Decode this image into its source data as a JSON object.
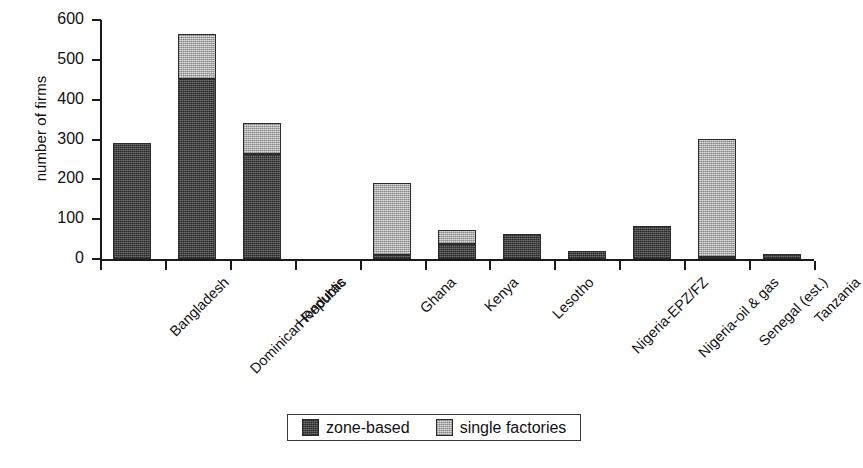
{
  "chart_data": {
    "type": "bar",
    "stacked": true,
    "title": "",
    "xlabel": "",
    "ylabel": "number of firms",
    "ylim": [
      0,
      600
    ],
    "ytick_values": [
      0,
      100,
      200,
      300,
      400,
      500,
      600
    ],
    "ytick_labels": [
      "0",
      "100",
      "200",
      "300",
      "400",
      "500",
      "600"
    ],
    "grid": false,
    "legend_position": "bottom-center",
    "categories": [
      "Bangladesh",
      "Dominican Republic",
      "Honduras",
      "",
      "Ghana",
      "Kenya",
      "Lesotho",
      "Nigeria-EPZ/FZ",
      "Nigeria-oil & gas",
      "Senegal (est.)",
      "Tanzania"
    ],
    "series": [
      {
        "name": "zone-based",
        "color": "#4d4d4d",
        "values": [
          292,
          452,
          263,
          null,
          11,
          37,
          64,
          20,
          83,
          5,
          13
        ]
      },
      {
        "name": "single factories",
        "color": "#b8b8b8",
        "values": [
          0,
          112,
          78,
          null,
          180,
          37,
          0,
          0,
          0,
          296,
          0
        ]
      }
    ],
    "totals": [
      292,
      564,
      341,
      null,
      191,
      74,
      64,
      20,
      83,
      301,
      13
    ]
  },
  "axis": {
    "y_title": "number of firms"
  },
  "legend": {
    "items": [
      {
        "label": "zone-based",
        "swatch": "dark-swatch-icon"
      },
      {
        "label": "single factories",
        "swatch": "light-swatch-icon"
      }
    ]
  }
}
